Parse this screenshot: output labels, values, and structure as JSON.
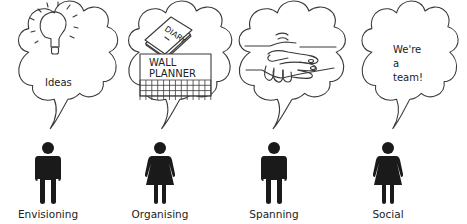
{
  "diagram": {
    "type": "team-roles",
    "roles": [
      {
        "label": "Envisioning",
        "figure": "man",
        "bubble_icon": "lightbulb-icon",
        "bubble_text": [
          "Ideas"
        ]
      },
      {
        "label": "Organising",
        "figure": "woman",
        "bubble_icon": "diary-and-wall-planner-icon",
        "bubble_text": [
          "DIARY",
          "WALL",
          "PLANNER"
        ]
      },
      {
        "label": "Spanning",
        "figure": "man",
        "bubble_icon": "handshake-icon",
        "bubble_text": []
      },
      {
        "label": "Social",
        "figure": "woman",
        "bubble_icon": "speech-text",
        "bubble_text": [
          "We're",
          "a",
          "team!"
        ]
      }
    ]
  }
}
